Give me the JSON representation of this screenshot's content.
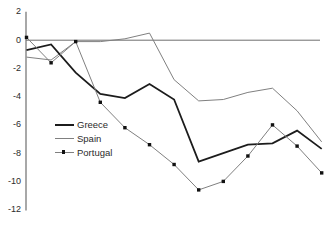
{
  "chart_data": {
    "type": "line",
    "title": "",
    "xlabel": "",
    "ylabel": "",
    "x": [
      1,
      2,
      3,
      4,
      5,
      6,
      7,
      8,
      9,
      10,
      11,
      12,
      13
    ],
    "x_tick_labels_visible": false,
    "series": [
      {
        "name": "Greece",
        "color": "#1c1c1c",
        "stroke_width": 1.8,
        "marker": "none",
        "values": [
          -0.7,
          -0.3,
          -2.3,
          -3.8,
          -4.1,
          -3.1,
          -4.2,
          -8.6,
          -8.0,
          -7.4,
          -7.3,
          -6.4,
          -7.7
        ]
      },
      {
        "name": "Spain",
        "color": "#808080",
        "stroke_width": 1,
        "marker": "none",
        "values": [
          -1.2,
          -1.4,
          -0.1,
          -0.1,
          0.1,
          0.5,
          -2.8,
          -4.3,
          -4.2,
          -3.7,
          -3.4,
          -5.0,
          -7.2
        ]
      },
      {
        "name": "Portugal",
        "color": "#808080",
        "stroke_width": 1,
        "marker": "square",
        "marker_color": "#111111",
        "values": [
          0.2,
          -1.6,
          -0.1,
          -4.4,
          -6.2,
          -7.4,
          -8.8,
          -10.6,
          -10.0,
          -8.2,
          -6.0,
          -7.5,
          -9.4
        ]
      }
    ],
    "ylim": [
      -12,
      2
    ],
    "yticks": [
      2,
      0,
      -2,
      -4,
      -6,
      -8,
      -10,
      -12
    ],
    "ytick_labels": [
      "2",
      "0",
      "-2",
      "-4",
      "-6",
      "-8",
      "-10",
      "-12"
    ],
    "grid": "zero-line-only",
    "zero_line": true,
    "legend_position": "inside-left-middle",
    "axis_color": "#6e6e6e",
    "zero_line_color": "#6e6e6e"
  },
  "legend": {
    "items": [
      {
        "label": "Greece"
      },
      {
        "label": "Spain"
      },
      {
        "label": "Portugal"
      }
    ]
  }
}
